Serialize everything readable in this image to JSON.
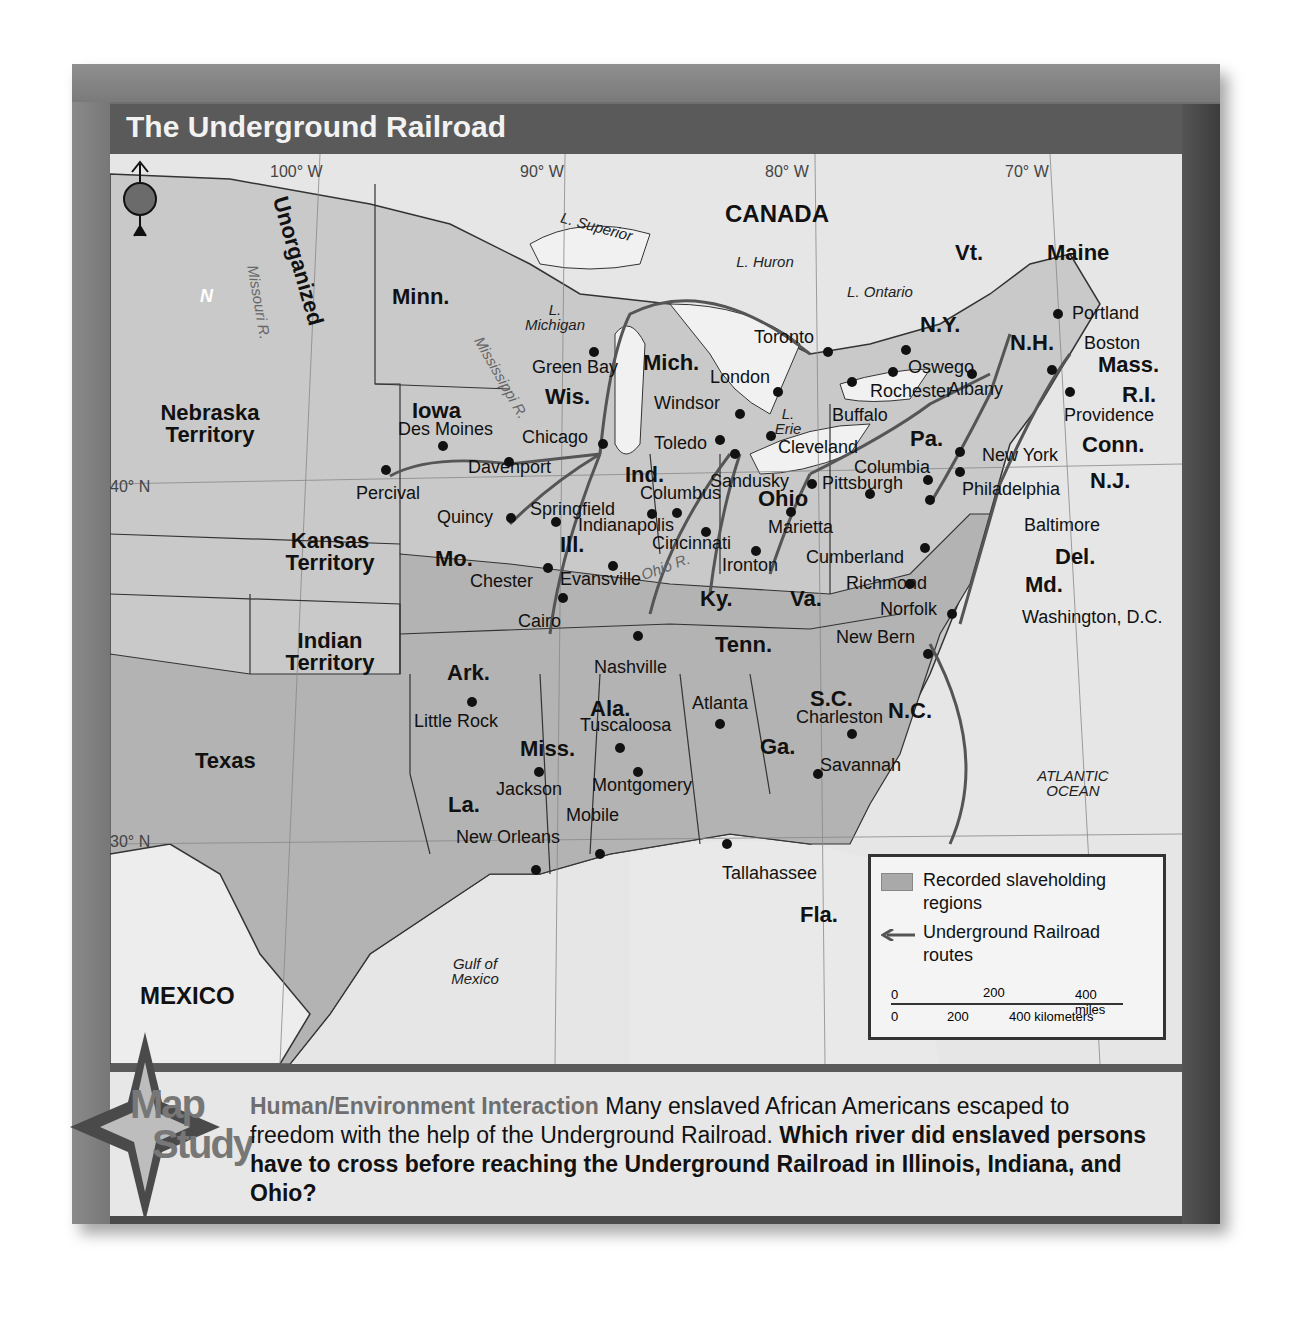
{
  "title": "The Underground Railroad",
  "graticule": {
    "longitudes": [
      "100° W",
      "90° W",
      "80° W",
      "70° W"
    ],
    "latitudes": [
      "40° N",
      "30° N"
    ]
  },
  "regions": {
    "countries": [
      "CANADA",
      "MEXICO"
    ],
    "territories": [
      "Unorganized",
      "Nebraska Territory",
      "Kansas Territory",
      "Indian Territory"
    ],
    "states": [
      "Minn.",
      "Iowa",
      "Wis.",
      "Mich.",
      "Ill.",
      "Ind.",
      "Ohio",
      "Pa.",
      "N.Y.",
      "Vt.",
      "Maine",
      "N.H.",
      "Mass.",
      "R.I.",
      "Conn.",
      "N.J.",
      "Del.",
      "Md.",
      "Va.",
      "Ky.",
      "Mo.",
      "Tenn.",
      "N.C.",
      "S.C.",
      "Ga.",
      "Ala.",
      "Miss.",
      "Ark.",
      "La.",
      "Texas",
      "Fla."
    ]
  },
  "water": {
    "lakes": [
      "L. Superior",
      "L. Michigan",
      "L. Huron",
      "L. Ontario",
      "L. Erie"
    ],
    "rivers": [
      "Missouri R.",
      "Mississippi R.",
      "Ohio R."
    ],
    "seas": [
      "Gulf of Mexico",
      "ATLANTIC OCEAN"
    ]
  },
  "cities": [
    "Percival",
    "Des Moines",
    "Davenport",
    "Quincy",
    "Springfield",
    "Chester",
    "Cairo",
    "Chicago",
    "Green Bay",
    "Evansville",
    "Indianapolis",
    "Columbus",
    "Cincinnati",
    "Toledo",
    "Sandusky",
    "Cleveland",
    "Marietta",
    "Ironton",
    "Windsor",
    "London",
    "Toronto",
    "Buffalo",
    "Rochester",
    "Oswego",
    "Albany",
    "Portland",
    "Boston",
    "Providence",
    "New York",
    "Philadelphia",
    "Columbia",
    "Pittsburgh",
    "Baltimore",
    "Washington, D.C.",
    "Cumberland",
    "Richmond",
    "Norfolk",
    "New Bern",
    "Charleston",
    "Savannah",
    "Atlanta",
    "Tallahassee",
    "Nashville",
    "Little Rock",
    "Jackson",
    "Tuscaloosa",
    "Montgomery",
    "Mobile",
    "New Orleans"
  ],
  "compass": {
    "label": "N"
  },
  "legend": {
    "slaveholding": "Recorded slaveholding regions",
    "routes": "Underground Railroad routes",
    "scale": {
      "miles": [
        "0",
        "200",
        "400 miles"
      ],
      "km": [
        "0",
        "200",
        "400 kilometers"
      ]
    }
  },
  "map_study": {
    "badge_line1": "Map",
    "badge_line2": "Study",
    "heading": "Human/Environment Interaction",
    "body": " Many enslaved African Americans escaped to freedom with the help of the Underground Railroad. ",
    "question": "Which river did enslaved persons have to cross before reaching the Underground Railroad in Illinois, Indiana, and Ohio?"
  }
}
